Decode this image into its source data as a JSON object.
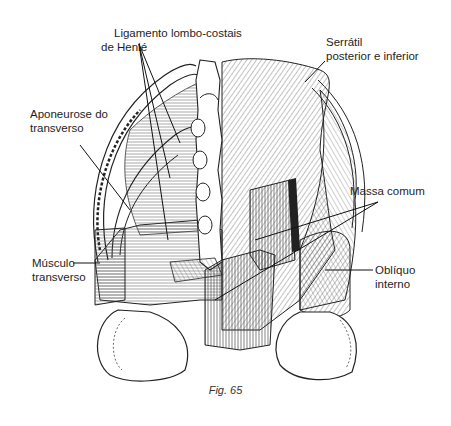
{
  "figure": {
    "caption": "Fig. 65",
    "colors": {
      "ink": "#1e1e1e",
      "background": "#ffffff"
    }
  },
  "labels": [
    {
      "id": "ligamento",
      "line1": "Ligamento lombo-costais",
      "line2": "de Henlé"
    },
    {
      "id": "serratil",
      "line1": "Serrátil",
      "line2": "posterior e inferior"
    },
    {
      "id": "aponeurose",
      "line1": "Aponeurose do",
      "line2": "transverso"
    },
    {
      "id": "massa",
      "line1": "Massa comum",
      "line2": ""
    },
    {
      "id": "musculo",
      "line1": "Músculo",
      "line2": "transverso"
    },
    {
      "id": "obliquo",
      "line1": "Oblíquo",
      "line2": "interno"
    }
  ]
}
